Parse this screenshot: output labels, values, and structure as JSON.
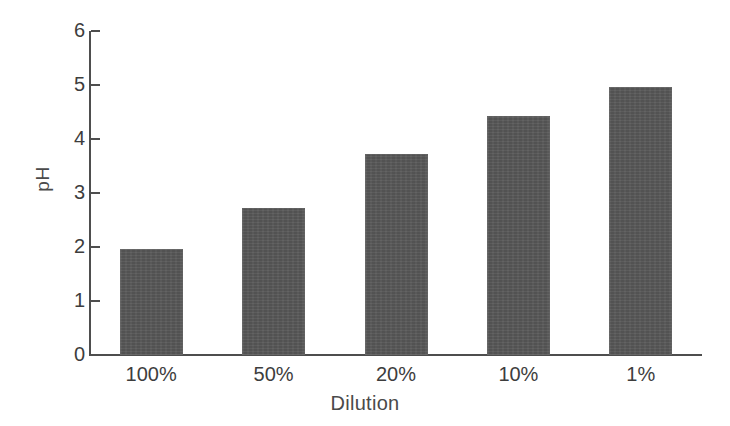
{
  "chart_data": {
    "type": "bar",
    "title": "",
    "subtitle": "",
    "xlabel": "Dilution",
    "ylabel": "pH",
    "categories": [
      "100%",
      "50%",
      "20%",
      "10%",
      "1%"
    ],
    "values": [
      1.97,
      2.73,
      3.72,
      4.43,
      4.96
    ],
    "series": [
      {
        "name": "pH",
        "values": [
          1.97,
          2.73,
          3.72,
          4.43,
          4.96
        ]
      }
    ],
    "ylim": [
      0,
      6
    ],
    "y_ticks": [
      0,
      1,
      2,
      3,
      4,
      5,
      6
    ],
    "y_tick_labels": [
      "0",
      "1",
      "2",
      "3",
      "4",
      "5",
      "6"
    ],
    "grid": false,
    "legend": false,
    "legend_position": "none",
    "bar_color": "#575757",
    "axis_color": "#4e4e4e",
    "background_color": "#ffffff",
    "annotations": []
  },
  "axes": {
    "y_title": "pH",
    "x_title": "Dilution"
  }
}
